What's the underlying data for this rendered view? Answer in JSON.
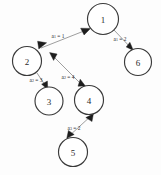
{
  "diagram": {
    "background_color": "#fdfdfd",
    "node_stroke_color": "#3a3a3a",
    "edge_stroke_color": "#8d8d8d",
    "arrow_color": "#1d1d1d",
    "nodes": [
      {
        "id": "1",
        "label": "1",
        "cx": 103,
        "cy": 19,
        "r": 15.5
      },
      {
        "id": "2",
        "label": "2",
        "cx": 27,
        "cy": 61,
        "r": 14.5
      },
      {
        "id": "3",
        "label": "3",
        "cx": 49,
        "cy": 101,
        "r": 14.0
      },
      {
        "id": "4",
        "label": "4",
        "cx": 89,
        "cy": 100,
        "r": 14.5
      },
      {
        "id": "5",
        "label": "5",
        "cx": 73,
        "cy": 152,
        "r": 14.5
      },
      {
        "id": "6",
        "label": "6",
        "cx": 138,
        "cy": 62,
        "r": 13.5
      }
    ],
    "edges": [
      {
        "id": "edge-2-1",
        "from": "2",
        "to": "1",
        "label_var": "a",
        "label_sub": "1",
        "label_value": "1",
        "label_text": "a₁ = 1",
        "label_x": 58,
        "label_y": 36,
        "bidirectional": true
      },
      {
        "id": "edge-1-6",
        "from": "1",
        "to": "6",
        "label_var": "a",
        "label_sub": "1",
        "label_value": "2",
        "label_text": "a₁ = 2",
        "label_x": 120,
        "label_y": 40,
        "bidirectional": false
      },
      {
        "id": "edge-2-3",
        "from": "2",
        "to": "3",
        "label_var": "a",
        "label_sub": "2",
        "label_value": "3",
        "label_text": "a₂ = 3",
        "label_x": 38,
        "label_y": 80,
        "bidirectional": true
      },
      {
        "id": "edge-4-2",
        "from": "4",
        "to": "2",
        "label_var": "a",
        "label_sub": "2",
        "label_value": "4",
        "label_text": "a₂ = 4",
        "label_x": 68,
        "label_y": 77,
        "bidirectional": true
      },
      {
        "id": "edge-5-4",
        "from": "5",
        "to": "4",
        "label_var": "a",
        "label_sub": "3",
        "label_value": "2",
        "label_text": "a₃ = 2",
        "label_x": 76,
        "label_y": 127,
        "bidirectional": true
      }
    ]
  }
}
